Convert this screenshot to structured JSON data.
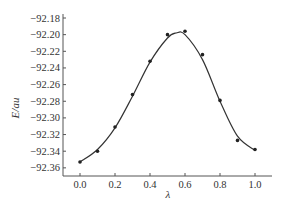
{
  "chart_data": {
    "type": "line",
    "title": "",
    "xlabel": "λ",
    "ylabel": "E/au",
    "xlim": [
      -0.05,
      1.07
    ],
    "ylim": [
      -92.37,
      -92.18
    ],
    "grid": false,
    "legend": null,
    "x_ticks": [
      "0.0",
      "0.2",
      "0.4",
      "0.6",
      "0.8",
      "1.0"
    ],
    "y_ticks": [
      "-92.18",
      "-92.20",
      "-92.22",
      "-92.24",
      "-92.26",
      "-92.28",
      "-92.30",
      "-92.32",
      "-92.34",
      "-92.36"
    ],
    "series": [
      {
        "name": "calculated points",
        "style": "markers",
        "x": [
          0.0,
          0.1,
          0.2,
          0.3,
          0.4,
          0.5,
          0.6,
          0.7,
          0.8,
          0.9,
          1.0
        ],
        "values": [
          -92.353,
          -92.34,
          -92.311,
          -92.272,
          -92.232,
          -92.2,
          -92.196,
          -92.224,
          -92.279,
          -92.327,
          -92.338
        ]
      },
      {
        "name": "fitted curve",
        "style": "smooth-line",
        "x": [
          0.0,
          0.1,
          0.2,
          0.3,
          0.4,
          0.5,
          0.55,
          0.6,
          0.7,
          0.8,
          0.9,
          1.0
        ],
        "values": [
          -92.353,
          -92.338,
          -92.312,
          -92.274,
          -92.233,
          -92.204,
          -92.198,
          -92.2,
          -92.23,
          -92.28,
          -92.322,
          -92.339
        ]
      }
    ]
  },
  "axes": {
    "ylabel": "E/au",
    "xlabel": "λ"
  }
}
